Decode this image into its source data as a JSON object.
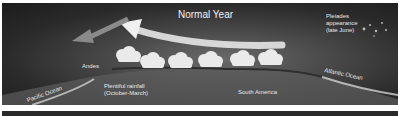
{
  "diagram": {
    "title": "Normal Year",
    "labels": {
      "andes": "Andes",
      "pacific": "Pacific Ocean",
      "atlantic": "Atlantic Ocean",
      "rainfall_line1": "Plentiful rainfall",
      "rainfall_line2": "(October-March)",
      "south_america": "South America",
      "pleiades_line1": "Pleiades",
      "pleiades_line2": "appearance",
      "pleiades_line3": "(late June)"
    },
    "clouds_count": 6,
    "colors": {
      "sky_dark": "#1c1c1c",
      "land": "#6a6a6a",
      "wind_arrow": "#e6e6e6",
      "pacific_arrow": "#8a8a8a",
      "coast": "#cfcfcf"
    }
  }
}
